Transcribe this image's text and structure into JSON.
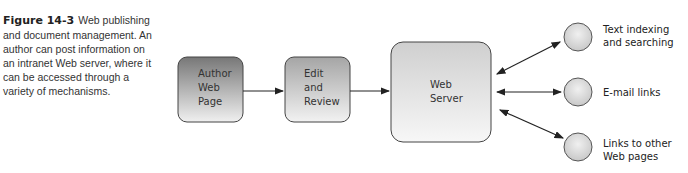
{
  "caption": {
    "figure_label": "Figure 14-3",
    "text": "Web publishing and document management. An author can post information on an intranet Web server, where it can be accessed through a variety of mechanisms."
  },
  "nodes": {
    "author": {
      "line1": "Author",
      "line2": "Web",
      "line3": "Page"
    },
    "edit": {
      "line1": "Edit",
      "line2": "and",
      "line3": "Review"
    },
    "server": {
      "line1": "Web",
      "line2": "Server"
    }
  },
  "outputs": [
    {
      "line1": "Text indexing",
      "line2": "and searching"
    },
    {
      "line1": "E-mail links",
      "line2": ""
    },
    {
      "line1": "Links to other",
      "line2": "Web pages"
    }
  ],
  "colors": {
    "author_fill_top": "#7a7a7a",
    "author_fill_bottom": "#eeeeee",
    "edit_fill_top": "#a8a8a8",
    "server_fill_top": "#cfcfcf",
    "stroke": "#444444",
    "circle_fill": "#d6d6d6"
  }
}
